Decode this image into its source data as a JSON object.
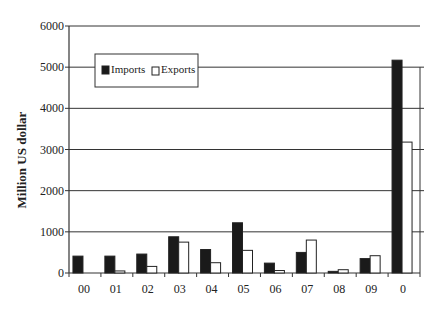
{
  "chart_data": {
    "type": "bar",
    "title": "",
    "xlabel": "",
    "ylabel": "Million US dollar",
    "ylim": [
      0,
      6000
    ],
    "yticks": [
      0,
      1000,
      2000,
      3000,
      4000,
      5000,
      6000
    ],
    "grid": true,
    "legend_position": "upper-left (inside plot)",
    "categories": [
      "00",
      "01",
      "02",
      "03",
      "04",
      "05",
      "06",
      "07",
      "08",
      "09",
      "0"
    ],
    "series": [
      {
        "name": "Imports",
        "color": "#1a1a1a",
        "values": [
          410,
          410,
          460,
          880,
          570,
          1220,
          240,
          500,
          40,
          350,
          5170
        ]
      },
      {
        "name": "Exports",
        "color": "#ffffff",
        "values": [
          0,
          50,
          160,
          750,
          250,
          550,
          60,
          800,
          80,
          420,
          3180
        ]
      }
    ]
  }
}
